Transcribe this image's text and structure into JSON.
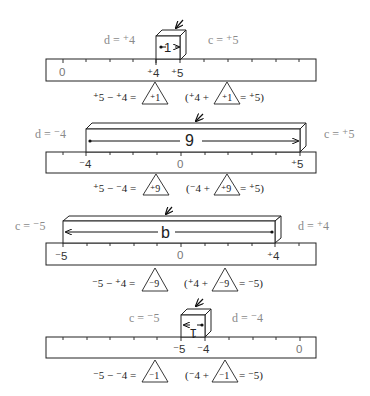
{
  "diagrams": [
    {
      "id": "d1",
      "left_label": "d = ⁺4",
      "right_label": "c = ⁺5",
      "length_label": "1",
      "ruler_labels": [
        "0",
        "⁺4",
        "⁺5"
      ],
      "equation": {
        "lhs": "⁺5 − ⁺4 =",
        "answer": "⁺1",
        "check_open": "(⁺4 +",
        "check_answer": "⁺1",
        "check_close": "= ⁺5)"
      }
    },
    {
      "id": "d2",
      "left_label": "d = ⁻4",
      "right_label": "c = ⁺5",
      "length_label": "9",
      "ruler_labels": [
        "⁻4",
        "0",
        "⁺5"
      ],
      "equation": {
        "lhs": "⁺5 − ⁻4 =",
        "answer": "⁺9",
        "check_open": "(⁻4 +",
        "check_answer": "⁺9",
        "check_close": "= ⁺5)"
      }
    },
    {
      "id": "d3",
      "left_label": "c = ⁻5",
      "right_label": "d = ⁺4",
      "length_label": "b",
      "ruler_labels": [
        "⁻5",
        "0",
        "⁺4"
      ],
      "equation": {
        "lhs": "⁻5 − ⁺4 =",
        "answer": "⁻9",
        "check_open": "(⁺4 +",
        "check_answer": "⁻9",
        "check_close": "= ⁻5)"
      }
    },
    {
      "id": "d4",
      "left_label": "c = ⁻5",
      "right_label": "d = ⁻4",
      "length_label": "1",
      "ruler_labels": [
        "⁻5",
        "⁻4",
        "0"
      ],
      "equation": {
        "lhs": "⁻5 − ⁻4 =",
        "answer": "⁻1",
        "check_open": "(⁻4 +",
        "check_answer": "⁻1",
        "check_close": "= ⁻5)"
      }
    }
  ],
  "icons": {
    "pointer": "pointer-arrow-icon",
    "triangle": "answer-triangle"
  }
}
